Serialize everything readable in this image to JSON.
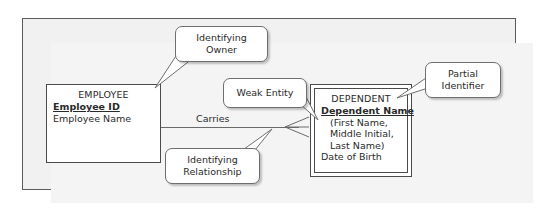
{
  "figure": {
    "type": "er-diagram",
    "background_color": "#f2f2f2",
    "frame_color": "#5b5b5b"
  },
  "entities": [
    {
      "name": "EMPLOYEE",
      "kind": "strong-entity",
      "attributes": [
        {
          "label": "Employee ID",
          "role": "identifier"
        },
        {
          "label": "Employee Name",
          "role": "attribute"
        }
      ]
    },
    {
      "name": "DEPENDENT",
      "kind": "weak-entity",
      "attributes": [
        {
          "label": "Dependent Name",
          "role": "partial-identifier"
        },
        {
          "label": "(First Name,",
          "role": "component"
        },
        {
          "label": "Middle Initial,",
          "role": "component"
        },
        {
          "label": "Last Name)",
          "role": "component"
        },
        {
          "label": "Date of Birth",
          "role": "attribute"
        }
      ]
    }
  ],
  "relationship": {
    "label": "Carries",
    "kind": "identifying-relationship",
    "from": "EMPLOYEE",
    "to": "DEPENDENT",
    "to_cardinality": "many"
  },
  "callouts": [
    {
      "id": "identifying-owner",
      "text": "Identifying\nOwner",
      "line1": "Identifying",
      "line2": "Owner",
      "points_to": "EMPLOYEE"
    },
    {
      "id": "weak-entity",
      "text": "Weak Entity",
      "line1": "Weak Entity",
      "line2": "",
      "points_to": "DEPENDENT"
    },
    {
      "id": "partial-identifier",
      "text": "Partial\nIdentifier",
      "line1": "Partial",
      "line2": "Identifier",
      "points_to": "Dependent Name"
    },
    {
      "id": "identifying-relationship",
      "text": "Identifying\nRelationship",
      "line1": "Identifying",
      "line2": "Relationship",
      "points_to": "Carries"
    }
  ]
}
